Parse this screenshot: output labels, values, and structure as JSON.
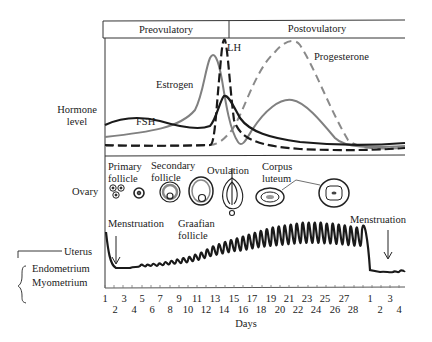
{
  "phases": {
    "preovulatory": "Preovulatory",
    "postovulatory": "Postovulatory"
  },
  "hormone_axis": {
    "label_line1": "Hormone",
    "label_line2": "level"
  },
  "hormones": {
    "fsh": {
      "label": "FSH",
      "style": "solid",
      "color": "#1a1a1a"
    },
    "lh": {
      "label": "LH",
      "style": "dashed",
      "color": "#1a1a1a"
    },
    "estrogen": {
      "label": "Estrogen",
      "style": "solid",
      "color": "#808080"
    },
    "progesterone": {
      "label": "Progesterone",
      "style": "dashed",
      "color": "#8a8a8a"
    }
  },
  "ovary": {
    "row_label": "Ovary",
    "stages": {
      "primary_l1": "Primary",
      "primary_l2": "follicle",
      "secondary_l1": "Secondary",
      "secondary_l2": "follicle",
      "graafian_l1": "Graafian",
      "graafian_l2": "follicle",
      "ovulation": "Ovulation",
      "corpus_l1": "Corpus",
      "corpus_l2": "luteum"
    }
  },
  "uterus": {
    "uterus_label": "Uterus",
    "endometrium_label": "Endometrium",
    "myometrium_label": "Myometrium",
    "menstruation_start": "Menstruation",
    "menstruation_end": "Menstruation"
  },
  "x_axis": {
    "label": "Days",
    "odd_ticks": [
      "1",
      "3",
      "5",
      "7",
      "9",
      "11",
      "13",
      "15",
      "17",
      "19",
      "21",
      "23",
      "25",
      "27",
      "1",
      "3"
    ],
    "even_ticks": [
      "2",
      "4",
      "6",
      "8",
      "10",
      "12",
      "14",
      "16",
      "18",
      "20",
      "22",
      "24",
      "26",
      "28",
      "2",
      "4"
    ]
  }
}
